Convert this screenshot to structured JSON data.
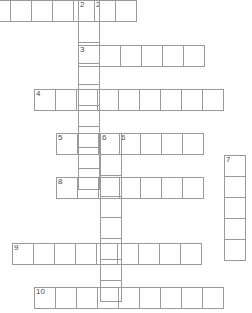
{
  "puzzle": {
    "title": "Crossword Grid",
    "cell_size": 22,
    "width": 252,
    "height": 313,
    "border_color": "#9a9a9a",
    "number_color": "#4a4a4a",
    "background": "#ffffff",
    "entries": [
      {
        "number": "",
        "direction": "across",
        "cells": 7,
        "x": -11,
        "y": 0,
        "clipped_left": true,
        "numbers_in_cells": [
          "",
          "",
          "",
          "",
          "",
          "2",
          ""
        ]
      },
      {
        "number": "2",
        "direction": "down",
        "cells": 9,
        "x": 78,
        "y": 0,
        "numbers_in_cells": [
          "2",
          "",
          "",
          "",
          "",
          "",
          "",
          "",
          ""
        ]
      },
      {
        "number": "3",
        "direction": "across",
        "cells": 6,
        "x": 78,
        "y": 45,
        "numbers_in_cells": [
          "3",
          "",
          "",
          "",
          "",
          ""
        ]
      },
      {
        "number": "4",
        "direction": "across",
        "cells": 9,
        "x": 34,
        "y": 89,
        "numbers_in_cells": [
          "4",
          "",
          "",
          "",
          "",
          "",
          "",
          "",
          ""
        ]
      },
      {
        "number": "5",
        "direction": "across",
        "cells": 7,
        "x": 56,
        "y": 133,
        "numbers_in_cells": [
          "5",
          "",
          "",
          "6",
          "",
          "",
          ""
        ]
      },
      {
        "number": "6",
        "direction": "down",
        "cells": 8,
        "x": 100,
        "y": 133,
        "numbers_in_cells": [
          "6",
          "",
          "",
          "",
          "",
          "",
          "",
          ""
        ]
      },
      {
        "number": "7",
        "direction": "down",
        "cells": 5,
        "x": 224,
        "y": 155,
        "numbers_in_cells": [
          "7",
          "",
          "",
          "",
          ""
        ]
      },
      {
        "number": "8",
        "direction": "across",
        "cells": 7,
        "x": 56,
        "y": 177,
        "numbers_in_cells": [
          "8",
          "",
          "",
          "",
          "",
          "",
          ""
        ]
      },
      {
        "number": "9",
        "direction": "across",
        "cells": 9,
        "x": 12,
        "y": 243,
        "numbers_in_cells": [
          "9",
          "",
          "",
          "",
          "",
          "",
          "",
          "",
          ""
        ]
      },
      {
        "number": "10",
        "direction": "across",
        "cells": 9,
        "x": 34,
        "y": 287,
        "numbers_in_cells": [
          "10",
          "",
          "",
          "",
          "",
          "",
          "",
          "",
          ""
        ]
      }
    ]
  }
}
